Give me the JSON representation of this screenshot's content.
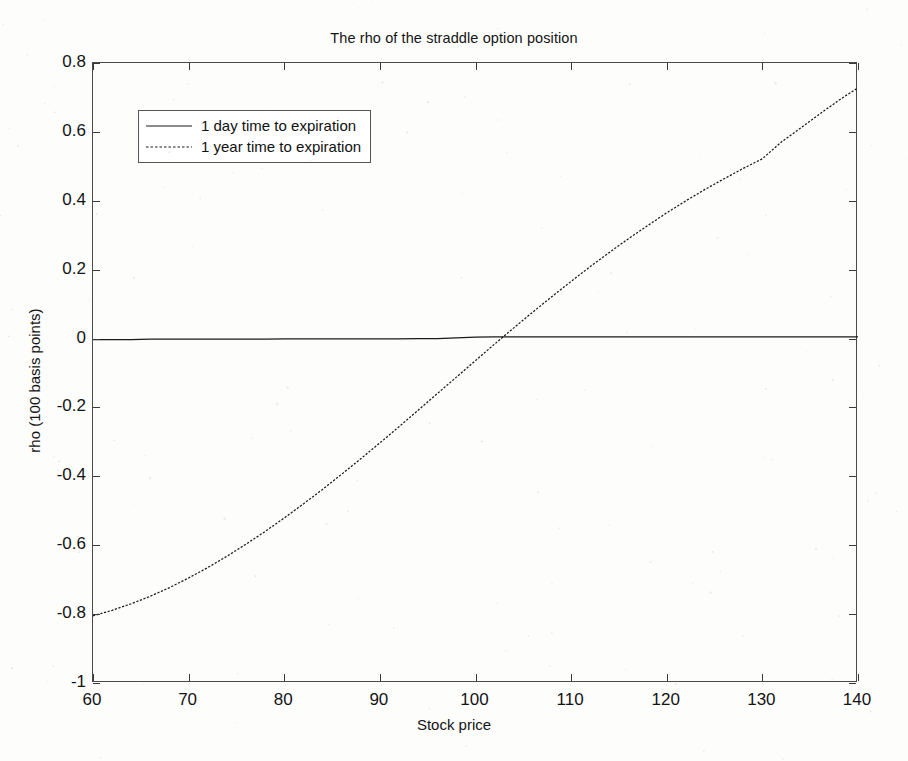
{
  "chart_data": {
    "type": "line",
    "title": "The rho of the straddle option position",
    "xlabel": "Stock price",
    "ylabel": "rho (100 basis points)",
    "xlim": [
      60,
      140
    ],
    "ylim": [
      -1,
      0.8
    ],
    "xticks": [
      60,
      70,
      80,
      90,
      100,
      110,
      120,
      130,
      140
    ],
    "xticklabels": [
      "60",
      "70",
      "80",
      "90",
      "100",
      "110",
      "120",
      "130",
      "140"
    ],
    "yticks": [
      -1,
      -0.8,
      -0.6,
      -0.4,
      -0.2,
      0,
      0.2,
      0.4,
      0.6,
      0.8
    ],
    "yticklabels": [
      "-1",
      "-0.8",
      "-0.6",
      "-0.4",
      "-0.2",
      "0",
      "0.2",
      "0.4",
      "0.6",
      "0.8"
    ],
    "grid": false,
    "legend_position": "upper left",
    "x": [
      60,
      62,
      64,
      66,
      68,
      70,
      72,
      74,
      76,
      78,
      80,
      82,
      84,
      86,
      88,
      90,
      92,
      94,
      96,
      98,
      100,
      102,
      104,
      106,
      108,
      110,
      112,
      114,
      116,
      118,
      120,
      122,
      124,
      126,
      128,
      130,
      132,
      134,
      136,
      138,
      140
    ],
    "series": [
      {
        "name": "1 day time to expiration",
        "linestyle": "solid",
        "color": "#1a1a1a",
        "values": [
          -0.003,
          -0.003,
          -0.003,
          -0.002,
          -0.002,
          -0.002,
          -0.002,
          -0.002,
          -0.002,
          -0.002,
          -0.001,
          -0.001,
          -0.001,
          -0.001,
          -0.001,
          -0.001,
          -0.001,
          0.0,
          0.0,
          0.002,
          0.004,
          0.005,
          0.005,
          0.005,
          0.005,
          0.005,
          0.005,
          0.005,
          0.005,
          0.005,
          0.005,
          0.005,
          0.005,
          0.005,
          0.005,
          0.005,
          0.005,
          0.005,
          0.005,
          0.005,
          0.005
        ]
      },
      {
        "name": "1 year time to expiration",
        "linestyle": "dotted",
        "color": "#1a1a1a",
        "values": [
          -0.805,
          -0.789,
          -0.77,
          -0.748,
          -0.723,
          -0.695,
          -0.665,
          -0.632,
          -0.597,
          -0.56,
          -0.521,
          -0.48,
          -0.438,
          -0.394,
          -0.349,
          -0.303,
          -0.256,
          -0.208,
          -0.16,
          -0.112,
          -0.064,
          -0.016,
          0.031,
          0.077,
          0.122,
          0.166,
          0.209,
          0.25,
          0.29,
          0.328,
          0.365,
          0.4,
          0.433,
          0.464,
          0.494,
          0.522,
          0.571,
          0.611,
          0.652,
          0.692,
          0.728
        ]
      }
    ]
  },
  "legend": {
    "entries": [
      {
        "label": "1 day time to expiration"
      },
      {
        "label": "1 year time to expiration"
      }
    ]
  }
}
